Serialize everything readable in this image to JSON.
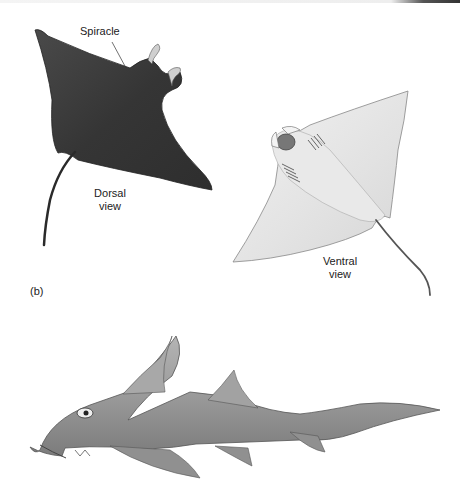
{
  "figure": {
    "panel_label": "(b)",
    "labels": {
      "spiracle": "Spiracle",
      "dorsal_line1": "Dorsal",
      "dorsal_line2": "view",
      "ventral_line1": "Ventral",
      "ventral_line2": "view"
    },
    "illustrations": [
      {
        "name": "manta-ray-dorsal",
        "view": "Dorsal view",
        "tone": "dark"
      },
      {
        "name": "manta-ray-ventral",
        "view": "Ventral view",
        "tone": "light"
      },
      {
        "name": "chimaera-side",
        "view": "lateral",
        "tone": "gray"
      }
    ],
    "colors": {
      "dorsal_body": "#3a3a3a",
      "ventral_body": "#e6e6e6",
      "chimaera_body": "#9a9a9a",
      "text": "#222222"
    }
  }
}
